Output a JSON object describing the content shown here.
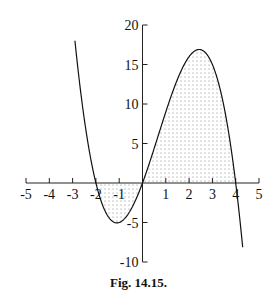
{
  "chart_data": {
    "type": "line",
    "title": "",
    "caption": "Fig. 14.15.",
    "function": "y = -x^3 + 2x^2 + 8x",
    "xlabel": "",
    "ylabel": "",
    "xlim": [
      -5,
      5
    ],
    "ylim": [
      -10,
      20
    ],
    "x_ticks": [
      -5,
      -4,
      -3,
      -2,
      -1,
      1,
      2,
      3,
      4,
      5
    ],
    "y_ticks": [
      -10,
      -5,
      5,
      10,
      15,
      20
    ],
    "x_tick_labels": [
      "-5",
      "-4",
      "-3",
      "-2",
      "-1",
      "1",
      "2",
      "3",
      "4",
      "5"
    ],
    "y_tick_labels": [
      "-10",
      "-5",
      "5",
      "10",
      "15",
      "20"
    ],
    "roots": [
      -2,
      0,
      4
    ],
    "local_min": {
      "x": -1.1,
      "y": -5.05
    },
    "local_max": {
      "x": 2.43,
      "y": 16.9
    },
    "shaded_regions": [
      {
        "from": -2,
        "to": 0,
        "pattern": "dots",
        "side": "below x-axis"
      },
      {
        "from": 0,
        "to": 4,
        "pattern": "dots",
        "side": "above x-axis"
      }
    ],
    "x": [
      -2.9,
      -2.5,
      -2,
      -1.5,
      -1,
      -0.5,
      0,
      0.5,
      1,
      1.5,
      2,
      2.5,
      3,
      3.5,
      4,
      4.3
    ],
    "values": [
      6.4,
      4.1,
      0,
      -3.6,
      -5,
      -3.4,
      0,
      4.4,
      9,
      12.9,
      16,
      16.9,
      15,
      9.6,
      0,
      -6.4
    ],
    "grid": false,
    "legend": null
  },
  "figure": {
    "caption": "Fig. 14.15."
  }
}
